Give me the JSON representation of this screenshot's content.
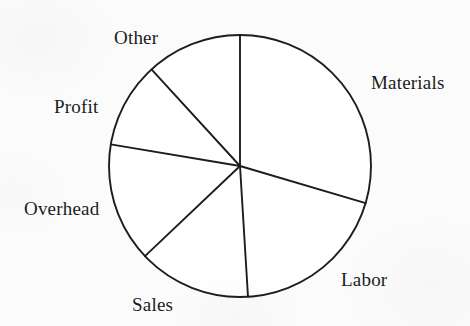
{
  "figure": {
    "background_color": "#fbfbfb",
    "ink_color": "#1d1d1d",
    "slice_fill_color": "#ffffff"
  },
  "chart_data": {
    "type": "pie",
    "title": "",
    "subtitle": "",
    "xlabel": "",
    "ylabel": "",
    "grid": false,
    "legend_position": "none",
    "labels_position": "outside",
    "center": {
      "x": 240,
      "y": 166
    },
    "radius": 131,
    "start_angle_deg": 90,
    "direction": "clockwise",
    "categories": [
      "Materials",
      "Labor",
      "Sales",
      "Overhead",
      "Profit",
      "Other"
    ],
    "values": [
      106.5,
      70,
      50,
      53,
      38,
      42.5
    ],
    "value_unit": "degrees",
    "percentages": [
      29.6,
      19.4,
      13.9,
      14.7,
      10.6,
      11.8
    ],
    "slices": [
      {
        "label": "Materials",
        "angle_deg": 106.5,
        "percent": 29.6,
        "start_deg": 90,
        "end_deg": -16.5,
        "label_x": 371,
        "label_y": 73
      },
      {
        "label": "Labor",
        "angle_deg": 70,
        "percent": 19.4,
        "start_deg": -16.5,
        "end_deg": -86.5,
        "label_x": 341,
        "label_y": 270
      },
      {
        "label": "Sales",
        "angle_deg": 50,
        "percent": 13.9,
        "start_deg": -86.5,
        "end_deg": -136.5,
        "label_x": 132,
        "label_y": 295
      },
      {
        "label": "Overhead",
        "angle_deg": 53,
        "percent": 14.7,
        "start_deg": -136.5,
        "end_deg": -189.5,
        "label_x": 24,
        "label_y": 199
      },
      {
        "label": "Profit",
        "angle_deg": 38,
        "percent": 10.6,
        "start_deg": -189.5,
        "end_deg": -227.5,
        "label_x": 54,
        "label_y": 97
      },
      {
        "label": "Other",
        "angle_deg": 42.5,
        "percent": 11.8,
        "start_deg": -227.5,
        "end_deg": -270,
        "label_x": 114,
        "label_y": 28
      }
    ],
    "boundary_points": [
      {
        "name": "top",
        "x": 240,
        "y": 35
      },
      {
        "name": "materials-labor",
        "x": 364,
        "y": 203
      },
      {
        "name": "labor-sales",
        "x": 253,
        "y": 297
      },
      {
        "name": "sales-overhead",
        "x": 137,
        "y": 243
      },
      {
        "name": "overhead-profit",
        "x": 110,
        "y": 163
      },
      {
        "name": "profit-other",
        "x": 137,
        "y": 86
      }
    ]
  }
}
